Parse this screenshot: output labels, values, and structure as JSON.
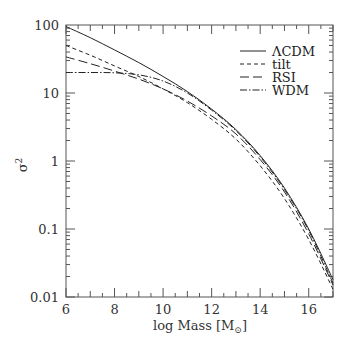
{
  "chart_data": {
    "type": "line",
    "title": "",
    "xlabel": "log Mass [M⊙]",
    "ylabel": "σ²",
    "xlim": [
      6,
      17
    ],
    "ylim": [
      0.01,
      100
    ],
    "yscale": "log",
    "grid": false,
    "legend_position": "upper right",
    "x_ticks": [
      6,
      8,
      10,
      12,
      14,
      16
    ],
    "x_tick_labels": [
      "6",
      "8",
      "10",
      "12",
      "14",
      "16"
    ],
    "y_ticks": [
      0.01,
      0.1,
      1,
      10,
      100
    ],
    "y_tick_labels": [
      "0.01",
      "0.1",
      "1",
      "10",
      "100"
    ],
    "x": [
      6,
      7,
      8,
      9,
      10,
      11,
      12,
      13,
      14,
      15,
      16,
      17
    ],
    "series": [
      {
        "name": "ΛCDM",
        "style": "solid",
        "values": [
          95,
          65,
          43,
          28,
          17.5,
          10.5,
          5.8,
          2.9,
          1.2,
          0.4,
          0.1,
          0.018
        ]
      },
      {
        "name": "tilt",
        "style": "dashed",
        "values": [
          50,
          36,
          25,
          17.5,
          11.5,
          7.2,
          4.1,
          2.1,
          0.85,
          0.28,
          0.07,
          0.013
        ]
      },
      {
        "name": "RSI",
        "style": "long-dashed",
        "values": [
          34,
          27,
          21,
          16,
          11.5,
          7.6,
          4.6,
          2.5,
          1.05,
          0.35,
          0.085,
          0.015
        ]
      },
      {
        "name": "WDM",
        "style": "dash-dot",
        "values": [
          20,
          20,
          19.8,
          18.5,
          15,
          10,
          5.6,
          2.8,
          1.15,
          0.38,
          0.095,
          0.016
        ]
      }
    ]
  },
  "axes": {
    "xlabel_prefix": "log Mass [M",
    "xlabel_sub": "⊙",
    "xlabel_suffix": "]",
    "ylabel": "σ",
    "ylabel_sup": "2"
  },
  "legend": {
    "items": [
      {
        "label": "ΛCDM"
      },
      {
        "label": "tilt"
      },
      {
        "label": "RSI"
      },
      {
        "label": "WDM"
      }
    ]
  },
  "colors": {
    "line": "#222222",
    "axis": "#555555"
  }
}
